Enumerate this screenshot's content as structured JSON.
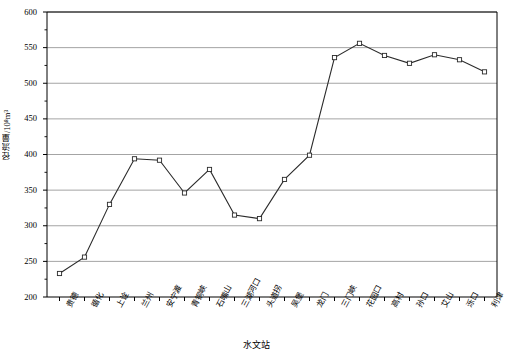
{
  "chart_data": {
    "type": "line",
    "title": "",
    "xlabel": "水文站",
    "ylabel": "径流量/10⁸m³",
    "ylim": [
      200,
      600
    ],
    "ytick_step": 50,
    "yticks": [
      200,
      250,
      300,
      350,
      400,
      450,
      500,
      550,
      600
    ],
    "minor_ytick_step": 25,
    "grid": "horizontal",
    "legend": "none",
    "marker": "open-square",
    "line_color": "#2b2b2b",
    "grid_color": "#9a9a9a",
    "axis_color": "#000000",
    "categories": [
      "贵德",
      "循化",
      "上诠",
      "兰州",
      "安宁渡",
      "青铜峡",
      "石嘴山",
      "三湖河口",
      "头道拐",
      "吴堡",
      "龙门",
      "三门峡",
      "花园口",
      "高村",
      "孙口",
      "艾山",
      "泺口",
      "利津"
    ],
    "values": [
      233,
      256,
      330,
      394,
      392,
      346,
      379,
      315,
      310,
      365,
      399,
      536,
      556,
      539,
      528,
      540,
      533,
      516
    ]
  },
  "axis": {
    "ytick_labels": [
      "600",
      "550",
      "500",
      "450",
      "400",
      "350",
      "300",
      "250",
      "200"
    ]
  }
}
